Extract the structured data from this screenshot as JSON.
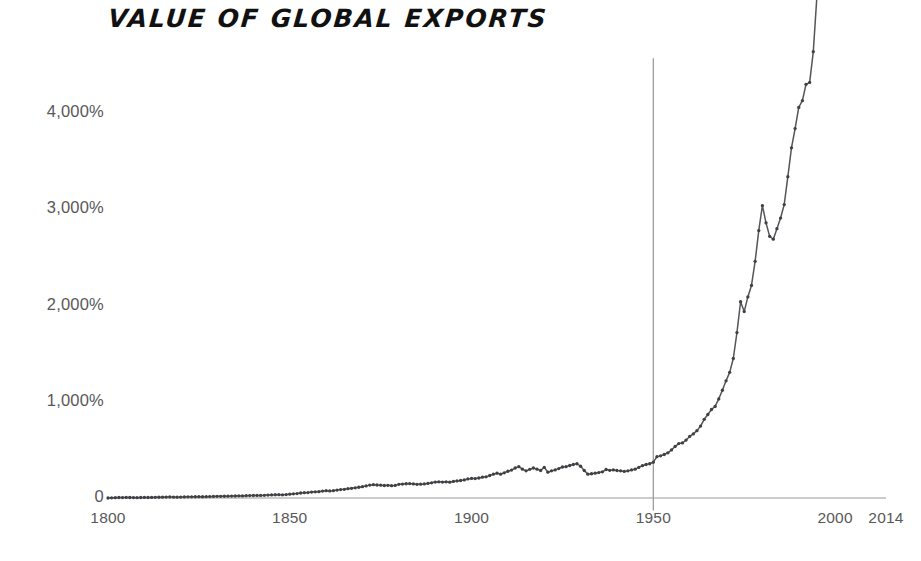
{
  "chart_data": {
    "type": "line",
    "title": "VALUE OF GLOBAL EXPORTS",
    "xlabel": "",
    "ylabel": "",
    "xlim": [
      1800,
      2014
    ],
    "ylim": [
      0,
      5050
    ],
    "grid": false,
    "legend": null,
    "value_suffix": "%",
    "y_ticks": [
      {
        "value": 4000,
        "label": "4,000%"
      },
      {
        "value": 3000,
        "label": "3,000%"
      },
      {
        "value": 2000,
        "label": "2,000%"
      },
      {
        "value": 1000,
        "label": "1,000%"
      },
      {
        "value": 0,
        "label": "0"
      }
    ],
    "x_ticks": [
      {
        "value": 1800,
        "label": "1800"
      },
      {
        "value": 1850,
        "label": "1850"
      },
      {
        "value": 1900,
        "label": "1900"
      },
      {
        "value": 1950,
        "label": "1950"
      },
      {
        "value": 2000,
        "label": "2000"
      },
      {
        "value": 2014,
        "label": "2014"
      }
    ],
    "annotations": [
      {
        "kind": "vertical-reference-line",
        "x": 1950,
        "y_top": 4570,
        "y_bottom": -130
      }
    ],
    "series": [
      {
        "name": "Value of global exports",
        "color": "#55555a",
        "marker": "circle",
        "x": [
          1800,
          1801,
          1802,
          1803,
          1804,
          1805,
          1806,
          1807,
          1808,
          1809,
          1810,
          1811,
          1812,
          1813,
          1814,
          1815,
          1816,
          1817,
          1818,
          1819,
          1820,
          1821,
          1822,
          1823,
          1824,
          1825,
          1826,
          1827,
          1828,
          1829,
          1830,
          1831,
          1832,
          1833,
          1834,
          1835,
          1836,
          1837,
          1838,
          1839,
          1840,
          1841,
          1842,
          1843,
          1844,
          1845,
          1846,
          1847,
          1848,
          1849,
          1850,
          1851,
          1852,
          1853,
          1854,
          1855,
          1856,
          1857,
          1858,
          1859,
          1860,
          1861,
          1862,
          1863,
          1864,
          1865,
          1866,
          1867,
          1868,
          1869,
          1870,
          1871,
          1872,
          1873,
          1874,
          1875,
          1876,
          1877,
          1878,
          1879,
          1880,
          1881,
          1882,
          1883,
          1884,
          1885,
          1886,
          1887,
          1888,
          1889,
          1890,
          1891,
          1892,
          1893,
          1894,
          1895,
          1896,
          1897,
          1898,
          1899,
          1900,
          1901,
          1902,
          1903,
          1904,
          1905,
          1906,
          1907,
          1908,
          1909,
          1910,
          1911,
          1912,
          1913,
          1914,
          1915,
          1916,
          1917,
          1918,
          1919,
          1920,
          1921,
          1922,
          1923,
          1924,
          1925,
          1926,
          1927,
          1928,
          1929,
          1930,
          1931,
          1932,
          1933,
          1934,
          1935,
          1936,
          1937,
          1938,
          1939,
          1940,
          1941,
          1942,
          1943,
          1944,
          1945,
          1946,
          1947,
          1948,
          1949,
          1950,
          1951,
          1952,
          1953,
          1954,
          1955,
          1956,
          1957,
          1958,
          1959,
          1960,
          1961,
          1962,
          1963,
          1964,
          1965,
          1966,
          1967,
          1968,
          1969,
          1970,
          1971,
          1972,
          1973,
          1974,
          1975,
          1976,
          1977,
          1978,
          1979,
          1980,
          1981,
          1982,
          1983,
          1984,
          1985,
          1986,
          1987,
          1988,
          1989,
          1990,
          1991,
          1992,
          1993,
          1994,
          1995,
          1996,
          1997,
          1998,
          1999,
          2000,
          2001,
          2002,
          2003,
          2004,
          2005,
          2006,
          2007,
          2008,
          2009,
          2010,
          2011,
          2012,
          2013,
          2014
        ],
        "y": [
          0,
          2,
          3,
          5,
          4,
          6,
          5,
          4,
          3,
          5,
          6,
          5,
          6,
          7,
          8,
          9,
          10,
          11,
          10,
          9,
          10,
          11,
          12,
          12,
          13,
          14,
          13,
          14,
          15,
          16,
          17,
          17,
          18,
          19,
          20,
          21,
          23,
          22,
          24,
          25,
          26,
          27,
          27,
          28,
          30,
          32,
          34,
          35,
          33,
          36,
          40,
          43,
          46,
          52,
          55,
          56,
          62,
          64,
          66,
          72,
          76,
          74,
          76,
          82,
          88,
          90,
          97,
          101,
          106,
          112,
          118,
          126,
          134,
          138,
          135,
          133,
          130,
          132,
          128,
          131,
          142,
          145,
          148,
          150,
          146,
          142,
          144,
          146,
          152,
          158,
          166,
          168,
          166,
          168,
          165,
          172,
          178,
          182,
          188,
          198,
          204,
          202,
          208,
          216,
          220,
          234,
          248,
          258,
          248,
          262,
          278,
          290,
          312,
          326,
          300,
          282,
          298,
          312,
          300,
          286,
          318,
          268,
          282,
          292,
          306,
          322,
          326,
          338,
          348,
          356,
          330,
          286,
          248,
          252,
          258,
          264,
          272,
          296,
          288,
          292,
          286,
          282,
          276,
          282,
          292,
          300,
          318,
          336,
          348,
          356,
          372,
          430,
          438,
          452,
          470,
          500,
          536,
          566,
          572,
          602,
          640,
          666,
          700,
          748,
          818,
          868,
          920,
          952,
          1030,
          1120,
          1218,
          1306,
          1450,
          1720,
          2040,
          1938,
          2090,
          2210,
          2460,
          2780,
          3040,
          2860,
          2720,
          2690,
          2800,
          2910,
          3050,
          3340,
          3640,
          3840,
          4060,
          4130,
          4300,
          4320,
          4640,
          5220,
          5380,
          5660,
          5700,
          5900,
          6380,
          6150,
          6360,
          7160,
          8520,
          9600,
          10800,
          12200,
          13400,
          10400,
          12700,
          14900,
          14800,
          15200,
          15400
        ]
      }
    ],
    "display_note": "Curve plotted as index percentage growth relative to 1800 baseline; visual y-axis shows 0 to above 4,000%."
  },
  "render": {
    "plot_left_px": 108,
    "plot_right_px": 886,
    "baseline_y_px": 498,
    "px_per_1000_pct": 96.2,
    "axis_color": "#8f8f8f",
    "line_color": "#55555a",
    "marker_color": "#3f3f44",
    "tick_text_color": "#585858",
    "title_color": "#111111",
    "background": "#ffffff"
  }
}
